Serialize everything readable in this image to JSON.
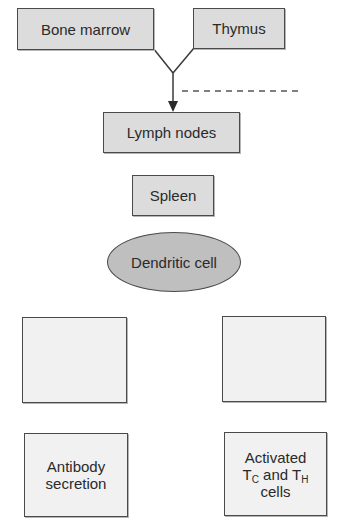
{
  "diagram": {
    "nodes": {
      "bone_marrow": {
        "label": "Bone marrow"
      },
      "thymus": {
        "label": "Thymus"
      },
      "lymph_nodes": {
        "label": "Lymph nodes"
      },
      "spleen": {
        "label": "Spleen"
      },
      "dendritic_cell": {
        "label": "Dendritic cell"
      },
      "blank_left": {
        "label": ""
      },
      "blank_right": {
        "label": ""
      },
      "antibody_secretion": {
        "line1": "Antibody",
        "line2": "secretion"
      },
      "activated_cells": {
        "line1": "Activated",
        "t1": "T",
        "sub1": "C",
        "and": " and ",
        "t2": "T",
        "sub2": "H",
        "line3": "cells"
      }
    },
    "edges": [
      {
        "from": "bone_marrow",
        "to": "lymph_nodes",
        "style": "solid-arrow"
      },
      {
        "from": "thymus",
        "to": "lymph_nodes",
        "style": "solid-arrow"
      },
      {
        "style": "dashed",
        "note": "horizontal dashed line right of junction"
      }
    ],
    "colors": {
      "top_box_fill": "#dcdcdc",
      "ellipse_fill": "#bfbfbf",
      "lower_box_fill": "#f1f1f1",
      "stroke": "#4a4a4a"
    }
  }
}
